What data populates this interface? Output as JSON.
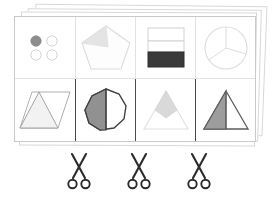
{
  "worksheet": {
    "title": "Fraction Shapes Cut-Out Worksheet",
    "sheet_count": 4,
    "grid": {
      "columns": 4,
      "rows": 2
    },
    "colors": {
      "page_background": "#ffffff",
      "sheet_border": "#c9c9c9",
      "stack_border": "#d8d8d8",
      "grid_line": "#e2e2e2",
      "cut_line": "#4a4a4a",
      "shape_outline_light": "#cfcfcf",
      "shape_outline_dark": "#555555",
      "fill_dark": "#3a3a3a",
      "fill_medium": "#999999",
      "fill_light": "#e8e8e8",
      "fill_pale": "#f2f2f2",
      "scissors": "#2b2b2b"
    }
  },
  "cells": [
    {
      "id": "cell-r0-c0",
      "row": 0,
      "column": 0,
      "shape": "circles-group",
      "label": "Four small circles, one shaded",
      "total_parts": 4,
      "shaded_parts": 1,
      "outline": "#cfcfcf",
      "fill": "#8d8d8d",
      "tone": "light"
    },
    {
      "id": "cell-r0-c1",
      "row": 0,
      "column": 1,
      "shape": "pentagon",
      "label": "Pentagon with shaded wedge",
      "total_parts": 5,
      "shaded_parts": 1,
      "outline": "#dcdcdc",
      "fill": "#e4e4e4",
      "tone": "light"
    },
    {
      "id": "cell-r0-c2",
      "row": 0,
      "column": 2,
      "shape": "rectangle-bars",
      "label": "Rectangle split into three bars, bottom shaded",
      "total_parts": 3,
      "shaded_parts": 1,
      "outline": "#d2d2d2",
      "fill": "#3a3a3a",
      "tone": "dark"
    },
    {
      "id": "cell-r0-c3",
      "row": 0,
      "column": 3,
      "shape": "circle-pie",
      "label": "Circle divided into pie sectors",
      "total_parts": 3,
      "shaded_parts": 0,
      "outline": "#dcdcdc",
      "fill": "none",
      "tone": "light"
    },
    {
      "id": "cell-r1-c0",
      "row": 1,
      "column": 0,
      "shape": "parallelogram-triangle",
      "label": "Parallelogram with inscribed triangle",
      "total_parts": 2,
      "shaded_parts": 1,
      "outline": "#9a9a9a",
      "fill": "#f2f2f2",
      "tone": "light"
    },
    {
      "id": "cell-r1-c1",
      "row": 1,
      "column": 1,
      "shape": "nonagon-half",
      "label": "Nonagon with left half shaded",
      "total_parts": 2,
      "shaded_parts": 1,
      "outline": "#3f3f3f",
      "fill": "#919191",
      "tone": "dark"
    },
    {
      "id": "cell-r1-c2",
      "row": 1,
      "column": 2,
      "shape": "triangle-kite",
      "label": "Triangle with shaded kite at apex",
      "total_parts": 4,
      "shaded_parts": 1,
      "outline": "#e0e0e0",
      "fill": "#d9d9d9",
      "tone": "light"
    },
    {
      "id": "cell-r1-c3",
      "row": 1,
      "column": 3,
      "shape": "triangle-half",
      "label": "Triangle with left half shaded",
      "total_parts": 2,
      "shaded_parts": 1,
      "outline": "#5c5c5c",
      "fill": "#9d9d9d",
      "tone": "dark"
    }
  ],
  "cut_marks": [
    {
      "id": "cut-1",
      "icon": "scissors-icon",
      "position": 1
    },
    {
      "id": "cut-2",
      "icon": "scissors-icon",
      "position": 2
    },
    {
      "id": "cut-3",
      "icon": "scissors-icon",
      "position": 3
    }
  ]
}
